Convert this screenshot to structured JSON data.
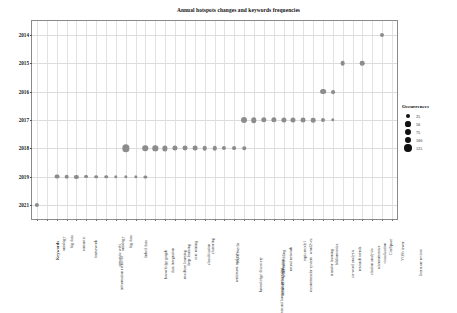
{
  "chart_data": {
    "type": "scatter",
    "title": "Annual hotspots changes and keywords frequencies",
    "xlabel": "",
    "ylabel": "",
    "grid": true,
    "legend": {
      "title": "Occurrences",
      "position": "right",
      "entries": [
        {
          "label": "25",
          "value": 25
        },
        {
          "label": "50",
          "value": 50
        },
        {
          "label": "75",
          "value": 75
        },
        {
          "label": "100",
          "value": 100
        },
        {
          "label": "125",
          "value": 125
        }
      ]
    },
    "y_categories": [
      "2014",
      "2015",
      "2016",
      "2017",
      "2018",
      "2019",
      "2021"
    ],
    "categories": [
      "Keywords",
      "ontology",
      "big data",
      "semantic",
      "framework",
      "information retrieval",
      "semantic web",
      "ontology",
      "big data",
      "linked data",
      "knowledge graph",
      "data integration",
      "machine learning",
      "deep learning",
      "text mining",
      "classification",
      "clustering",
      "sentiment analysis",
      "social media",
      "knowledge discovery",
      "natural language processing",
      "information extraction",
      "word embedding",
      "neural network",
      "recommender system",
      "topic model",
      "word2vec",
      "transfer learning",
      "bibliometrics",
      "co-word analysis",
      "research trends",
      "citation analysis",
      "scientometrics",
      "visualization",
      "CiteSpace",
      "VOSviewer",
      "literature review"
    ],
    "points": [
      {
        "year": "2014",
        "category_index": 35,
        "occurrences": 25
      },
      {
        "year": "2015",
        "category_index": 31,
        "occurrences": 40
      },
      {
        "year": "2015",
        "category_index": 33,
        "occurrences": 38
      },
      {
        "year": "2016",
        "category_index": 29,
        "occurrences": 70
      },
      {
        "year": "2016",
        "category_index": 30,
        "occurrences": 22
      },
      {
        "year": "2017",
        "category_index": 21,
        "occurrences": 78
      },
      {
        "year": "2017",
        "category_index": 22,
        "occurrences": 62
      },
      {
        "year": "2017",
        "category_index": 23,
        "occurrences": 58
      },
      {
        "year": "2017",
        "category_index": 24,
        "occurrences": 55
      },
      {
        "year": "2017",
        "category_index": 25,
        "occurrences": 52
      },
      {
        "year": "2017",
        "category_index": 26,
        "occurrences": 48
      },
      {
        "year": "2017",
        "category_index": 27,
        "occurrences": 44
      },
      {
        "year": "2017",
        "category_index": 28,
        "occurrences": 38
      },
      {
        "year": "2017",
        "category_index": 29,
        "occurrences": 26
      },
      {
        "year": "2017",
        "category_index": 30,
        "occurrences": 16
      },
      {
        "year": "2018",
        "category_index": 9,
        "occurrences": 125
      },
      {
        "year": "2018",
        "category_index": 11,
        "occurrences": 62
      },
      {
        "year": "2018",
        "category_index": 12,
        "occurrences": 58
      },
      {
        "year": "2018",
        "category_index": 13,
        "occurrences": 54
      },
      {
        "year": "2018",
        "category_index": 14,
        "occurrences": 50
      },
      {
        "year": "2018",
        "category_index": 15,
        "occurrences": 46
      },
      {
        "year": "2018",
        "category_index": 16,
        "occurrences": 42
      },
      {
        "year": "2018",
        "category_index": 17,
        "occurrences": 38
      },
      {
        "year": "2018",
        "category_index": 18,
        "occurrences": 34
      },
      {
        "year": "2018",
        "category_index": 19,
        "occurrences": 28
      },
      {
        "year": "2018",
        "category_index": 20,
        "occurrences": 22
      },
      {
        "year": "2018",
        "category_index": 21,
        "occurrences": 16
      },
      {
        "year": "2019",
        "category_index": 2,
        "occurrences": 44
      },
      {
        "year": "2019",
        "category_index": 3,
        "occurrences": 40
      },
      {
        "year": "2019",
        "category_index": 4,
        "occurrences": 30
      },
      {
        "year": "2019",
        "category_index": 5,
        "occurrences": 24
      },
      {
        "year": "2019",
        "category_index": 6,
        "occurrences": 20
      },
      {
        "year": "2019",
        "category_index": 7,
        "occurrences": 18
      },
      {
        "year": "2019",
        "category_index": 8,
        "occurrences": 16
      },
      {
        "year": "2019",
        "category_index": 9,
        "occurrences": 15
      },
      {
        "year": "2019",
        "category_index": 10,
        "occurrences": 14
      },
      {
        "year": "2019",
        "category_index": 11,
        "occurrences": 13
      },
      {
        "year": "2021",
        "category_index": 0,
        "occurrences": 30
      }
    ]
  }
}
